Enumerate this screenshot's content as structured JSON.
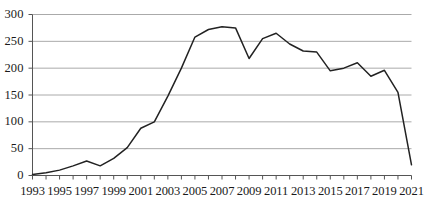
{
  "chart_data": {
    "type": "line",
    "title": "",
    "subtitle": "",
    "xlabel": "",
    "ylabel": "",
    "grid": true,
    "legend": false,
    "legend_position": "none",
    "line_color": "#222222",
    "grid_color": "#aaaaaa",
    "axis_color": "#555555",
    "xlim": [
      1993,
      2021
    ],
    "ylim": [
      0,
      300
    ],
    "y_ticks": [
      0,
      50,
      100,
      150,
      200,
      250,
      300
    ],
    "y_tick_labels": [
      "0",
      "50",
      "100",
      "150",
      "200",
      "250",
      "300"
    ],
    "x_ticks": [
      1993,
      1994,
      1995,
      1996,
      1997,
      1998,
      1999,
      2000,
      2001,
      2002,
      2003,
      2004,
      2005,
      2006,
      2007,
      2008,
      2009,
      2010,
      2011,
      2012,
      2013,
      2014,
      2015,
      2016,
      2017,
      2018,
      2019,
      2020,
      2021
    ],
    "x_tick_labels": [
      "1993",
      "1995",
      "1997",
      "1999",
      "2001",
      "2003",
      "2005",
      "2007",
      "2009",
      "2011",
      "2013",
      "2015",
      "2017",
      "2019",
      "2021"
    ],
    "x_tick_label_values": [
      1993,
      1995,
      1997,
      1999,
      2001,
      2003,
      2005,
      2007,
      2009,
      2011,
      2013,
      2015,
      2017,
      2019,
      2021
    ],
    "x": [
      1993,
      1994,
      1995,
      1996,
      1997,
      1998,
      1999,
      2000,
      2001,
      2002,
      2003,
      2004,
      2005,
      2006,
      2007,
      2008,
      2009,
      2010,
      2011,
      2012,
      2013,
      2014,
      2015,
      2016,
      2017,
      2018,
      2019,
      2020,
      2021
    ],
    "values": [
      2,
      5,
      10,
      18,
      27,
      18,
      32,
      52,
      88,
      100,
      148,
      200,
      258,
      272,
      277,
      275,
      218,
      255,
      265,
      245,
      232,
      230,
      195,
      200,
      210,
      185,
      196,
      155,
      20
    ]
  }
}
